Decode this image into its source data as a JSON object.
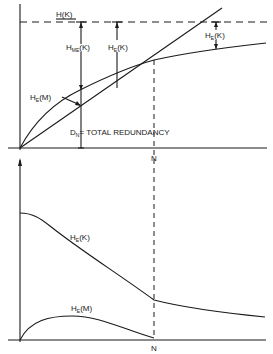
{
  "diagram": {
    "top_panel": {
      "labels": {
        "h_k": "H(K)",
        "h_me_k_main": "H",
        "h_me_k_sub": "ME",
        "h_me_k_arg": "(K)",
        "h_e_k_main": "H",
        "h_e_k_sub": "E",
        "h_e_k_arg": "(K)",
        "h_e_k_right_main": "H",
        "h_e_k_right_sub": "E",
        "h_e_k_right_arg": "(K)",
        "h_e_m_main": "H",
        "h_e_m_sub": "E",
        "h_e_m_arg": "(M)",
        "d_n_main": "D",
        "d_n_sub": "N",
        "d_n_text": "= TOTAL  REDUNDANCY",
        "n_tick": "N"
      }
    },
    "bottom_panel": {
      "labels": {
        "h_e_k_main": "H",
        "h_e_k_sub": "E",
        "h_e_k_arg": "(K)",
        "h_e_m_main": "H",
        "h_e_m_sub": "E",
        "h_e_m_arg": "(M)",
        "n_tick": "N"
      }
    },
    "colors": {
      "ink": "#1a1a1a",
      "background": "#ffffff"
    }
  }
}
